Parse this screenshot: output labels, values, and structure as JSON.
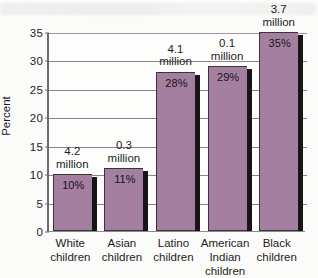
{
  "chart_data": {
    "type": "bar",
    "title": "",
    "subtitle": "",
    "xlabel": "",
    "ylabel": "Percent",
    "ylim": [
      0,
      35
    ],
    "ytick_step": 5,
    "yticks": [
      "0",
      "5",
      "10",
      "15",
      "20",
      "25",
      "30",
      "35"
    ],
    "grid": true,
    "legend": "none",
    "categories": [
      "White\nchildren",
      "Asian\nchildren",
      "Latino\nchildren",
      "American\nIndian\nchildren",
      "Black\nchildren"
    ],
    "values": [
      10,
      11,
      28,
      29,
      35
    ],
    "value_labels": [
      "10%",
      "11%",
      "28%",
      "29%",
      "35%"
    ],
    "annotations": [
      "4.2\nmillion",
      "0.3\nmillion",
      "4.1\nmillion",
      "0.1\nmillion",
      "3.7\nmillion"
    ],
    "colors": {
      "bar_fill": "#a47fa0",
      "bar_edge": "#3a3338",
      "bar_shadow": "#181418",
      "gridline": "#8d7f91",
      "gridline_top": "#a78fae",
      "axis": "#6d6a72",
      "background": "#fbfbfa",
      "plot_background": "#fdfdfc",
      "text": "#1d1d1d"
    }
  }
}
